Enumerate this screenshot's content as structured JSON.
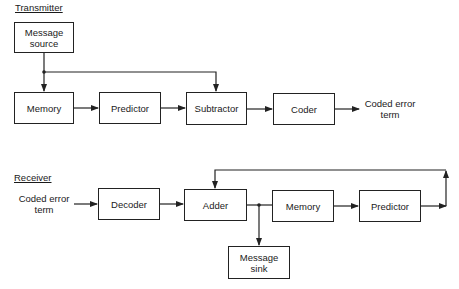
{
  "transmitter": {
    "title": "Transmitter",
    "blocks": {
      "message_source": "Message\nsource",
      "memory": "Memory",
      "predictor": "Predictor",
      "subtractor": "Subtractor",
      "coder": "Coder"
    },
    "output_label": "Coded error\nterm"
  },
  "receiver": {
    "title": "Receiver",
    "input_label": "Coded error\nterm",
    "blocks": {
      "decoder": "Decoder",
      "adder": "Adder",
      "memory": "Memory",
      "predictor": "Predictor",
      "message_sink": "Message\nsink"
    }
  }
}
